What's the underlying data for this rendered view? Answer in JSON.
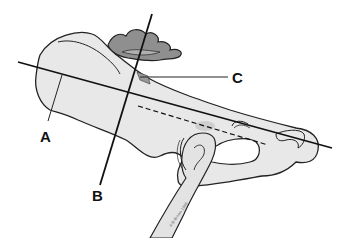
{
  "diagram": {
    "labels": [
      {
        "id": "A",
        "text": "A"
      },
      {
        "id": "B",
        "text": "B"
      },
      {
        "id": "C",
        "text": "C"
      }
    ],
    "copyright": "© B Brown 1998",
    "colors": {
      "bone_fill": "#e8e8e8",
      "outline": "#222222",
      "sacrum_fill": "#8a8a8a",
      "sacrum_inner": "#a8a8a8",
      "line": "#111111",
      "background": "#ffffff"
    }
  }
}
